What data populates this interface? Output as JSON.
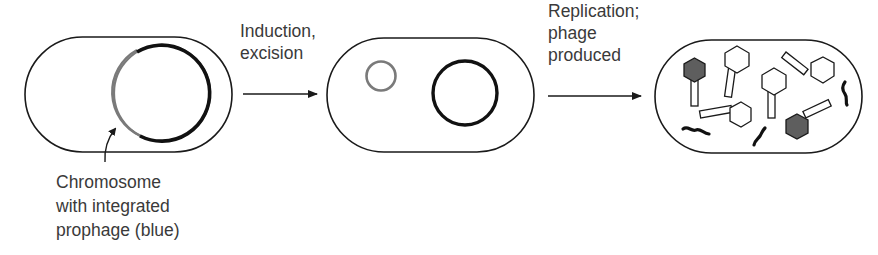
{
  "steps": [
    {
      "id": "lysogen",
      "caption_lines": [
        "Chromosome",
        "with integrated",
        "prophage (blue)"
      ]
    },
    {
      "id": "induced",
      "arrow_label_lines": [
        "Induction,",
        "excision"
      ]
    },
    {
      "id": "lytic",
      "arrow_label_lines": [
        "Replication;",
        "phage",
        "produced"
      ]
    }
  ],
  "colors": {
    "outline": "#1a1a1a",
    "prophage": "#7a7a7a",
    "chromosome": "#111111",
    "phage_head_filled": "#5e5e5e",
    "phage_head_empty": "#ffffff",
    "text": "#3a3a3a"
  }
}
